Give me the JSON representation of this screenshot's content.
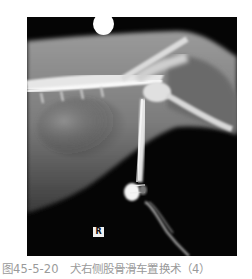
{
  "figure": {
    "marker_label": "R",
    "colors": {
      "background": "#050505",
      "bone": "#e8e8e8",
      "soft_tissue": "#8a8a8a",
      "caption": "#9a9a9a"
    }
  },
  "caption": {
    "text": "图45-5-20　犬右侧股骨滑车置换术（4）"
  }
}
